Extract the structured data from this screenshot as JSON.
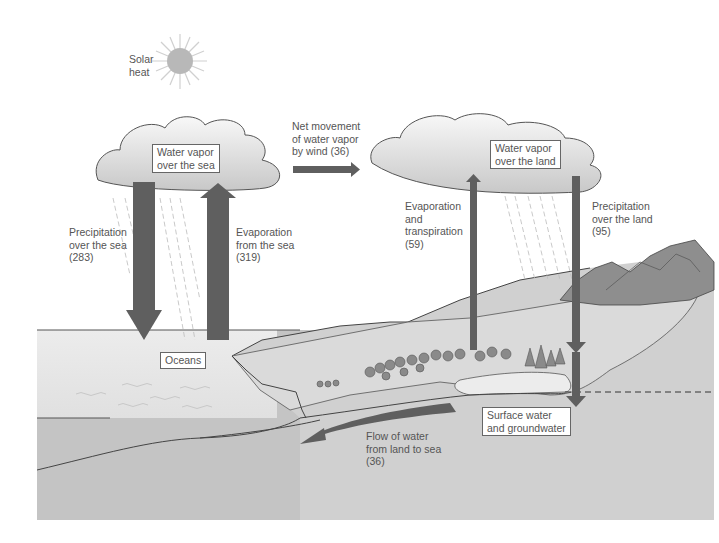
{
  "diagram": {
    "colors": {
      "arrow": "#5f5f5f",
      "sea_surface": "#e8e8e8",
      "deep_sea": "#bdbdbd",
      "land": "#d2d2d2",
      "mountain": "#8c8c8c",
      "sun": "#b4b4b4",
      "cloud": "#e6e6e6"
    },
    "sun_label": "Solar\nheat",
    "boxes": {
      "vapor_sea": "Water vapor\nover the sea",
      "vapor_land": "Water vapor\nover the land",
      "oceans": "Oceans",
      "surface_ground": "Surface water\nand groundwater"
    },
    "flows": [
      {
        "id": "precip_sea",
        "label": "Precipitation\nover the sea\n(283)",
        "value": 283,
        "direction": "down"
      },
      {
        "id": "evap_sea",
        "label": "Evaporation\nfrom the sea\n(319)",
        "value": 319,
        "direction": "up"
      },
      {
        "id": "wind",
        "label": "Net movement\nof water vapor\nby wind (36)",
        "value": 36,
        "direction": "right"
      },
      {
        "id": "evap_transp",
        "label": "Evaporation\nand\ntranspiration\n(59)",
        "value": 59,
        "direction": "up"
      },
      {
        "id": "precip_land",
        "label": "Precipitation\nover the land\n(95)",
        "value": 95,
        "direction": "down"
      },
      {
        "id": "runoff",
        "label": "Flow of water\nfrom land to sea\n(36)",
        "value": 36,
        "direction": "left"
      }
    ]
  }
}
